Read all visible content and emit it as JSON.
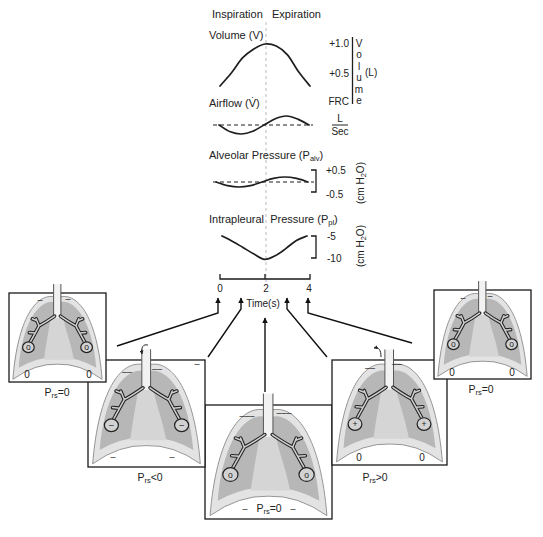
{
  "header": {
    "inspiration": "Inspiration",
    "expiration": "Expiration"
  },
  "volume": {
    "title": "Volume (V)",
    "ticks": [
      "+1.0",
      "+0.5",
      "FRC"
    ],
    "axis_label": "Volume",
    "unit": "(L)"
  },
  "airflow": {
    "title": "Airflow (V̇)",
    "unit_numerator": "L",
    "unit_denominator": "Sec"
  },
  "alveolar_pressure": {
    "title": "Alveolar Pressure (P",
    "title_sub": "alv",
    "title_close": ")",
    "ticks": [
      "+0.5",
      "-0.5"
    ],
    "unit": "(cm H",
    "unit_sub": "2",
    "unit_close": "O)"
  },
  "intrapleural_pressure": {
    "title": "Intrapleural  Pressure (P",
    "title_sub": "pl",
    "title_close": ")",
    "ticks": [
      "-5",
      "-10"
    ],
    "unit": "(cm H",
    "unit_sub": "2",
    "unit_close": "O)"
  },
  "time_axis": {
    "ticks": [
      "0",
      "2",
      "4"
    ],
    "label": "Time(s)"
  },
  "panels": [
    {
      "time": "0",
      "label": {
        "p": "P",
        "sub": "rs",
        "rel": "=0"
      },
      "alveoli_sign": "o",
      "apex_marks": [
        "–",
        "–"
      ],
      "base_marks": [
        "0",
        "0"
      ]
    },
    {
      "time": "1",
      "label": {
        "p": "P",
        "sub": "rs",
        "rel": "<0"
      },
      "alveoli_sign": "–",
      "apex_marks": [
        "––",
        "––"
      ],
      "corner_mark": "–",
      "base_marks": [
        "–",
        "–"
      ],
      "airflow": "in"
    },
    {
      "time": "2",
      "label": {
        "p": "P",
        "sub": "rs",
        "rel": "=0"
      },
      "alveoli_sign": "o",
      "apex_marks": [
        "–––",
        "–––"
      ],
      "base_marks": [
        "–",
        "–"
      ]
    },
    {
      "time": "3",
      "label": {
        "p": "P",
        "sub": "rs",
        "rel": ">0"
      },
      "alveoli_sign": "+",
      "apex_marks": [
        "––",
        "––"
      ],
      "base_marks": [
        "0",
        "0"
      ],
      "airflow": "out"
    },
    {
      "time": "4",
      "label": {
        "p": "P",
        "sub": "rs",
        "rel": "=0"
      },
      "alveoli_sign": "o",
      "apex_marks": [
        "–",
        "–"
      ],
      "base_marks": [
        "0",
        "0"
      ]
    }
  ],
  "colors": {
    "pleura": "#e3e3e3",
    "lung": "#b7b7b7",
    "mediastinum": "#d5d5d5",
    "ink": "#1e1e1e",
    "midline": "#b9b9b9"
  },
  "chart_data": {
    "type": "line",
    "title": "",
    "xlabel": "Time(s)",
    "x": [
      0,
      0.5,
      1,
      1.5,
      2,
      2.5,
      3,
      3.5,
      4
    ],
    "x_ticks": [
      "0",
      "2",
      "4"
    ],
    "phases": [
      "Inspiration",
      "Expiration"
    ],
    "phase_boundary_x": 2,
    "series": [
      {
        "name": "Volume (V)",
        "unit": "L",
        "yticks": [
          "FRC",
          "+0.5",
          "+1.0"
        ],
        "ylim": [
          0,
          1.0
        ],
        "values": [
          0,
          0.31,
          0.67,
          0.88,
          1.0,
          0.95,
          0.74,
          0.33,
          0
        ]
      },
      {
        "name": "Airflow (V̇)",
        "unit": "L/Sec",
        "baseline": 0,
        "values": [
          0,
          -0.38,
          -0.5,
          -0.35,
          0,
          0.35,
          0.5,
          0.33,
          0
        ]
      },
      {
        "name": "Alveolar Pressure (Palv)",
        "unit": "cm H2O",
        "yticks": [
          "-0.5",
          "+0.5"
        ],
        "ylim": [
          -0.5,
          0.5
        ],
        "baseline": 0,
        "values": [
          0,
          -0.18,
          -0.25,
          -0.18,
          0,
          0.18,
          0.25,
          0.18,
          0
        ]
      },
      {
        "name": "Intrapleural Pressure (Ppl)",
        "unit": "cm H2O",
        "yticks": [
          "-10",
          "-5"
        ],
        "ylim": [
          -10,
          -5
        ],
        "values": [
          -5,
          -6.2,
          -7.6,
          -9.0,
          -10.2,
          -9.4,
          -7.8,
          -6.0,
          -5
        ]
      }
    ]
  }
}
